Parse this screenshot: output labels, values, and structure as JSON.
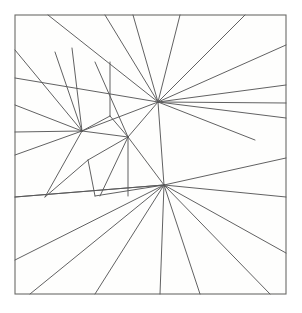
{
  "figure": {
    "name": "planar-line-arrangement",
    "caption": "",
    "canvas": {
      "width": 302,
      "height": 313
    },
    "colors": {
      "background": "#ffffff",
      "panel_fill": "#fefefd",
      "frame_stroke": "#6b6b68",
      "line_stroke": "#58585a"
    },
    "frame": {
      "x": 15,
      "y": 15,
      "width": 271,
      "height": 279
    },
    "hubs": [
      {
        "id": "hub-upper-right",
        "x": 158,
        "y": 102,
        "label": "A"
      },
      {
        "id": "hub-lower-center",
        "x": 164,
        "y": 185,
        "label": "B"
      },
      {
        "id": "hub-left",
        "x": 82,
        "y": 131,
        "label": "C"
      },
      {
        "id": "hub-middle",
        "x": 128,
        "y": 137,
        "label": "D"
      }
    ],
    "segments": [
      {
        "x1": 158,
        "y1": 102,
        "x2": 48,
        "y2": 15
      },
      {
        "x1": 158,
        "y1": 102,
        "x2": 105,
        "y2": 15
      },
      {
        "x1": 158,
        "y1": 102,
        "x2": 133,
        "y2": 15
      },
      {
        "x1": 158,
        "y1": 102,
        "x2": 180,
        "y2": 15
      },
      {
        "x1": 158,
        "y1": 102,
        "x2": 245,
        "y2": 15
      },
      {
        "x1": 158,
        "y1": 102,
        "x2": 286,
        "y2": 45
      },
      {
        "x1": 158,
        "y1": 102,
        "x2": 286,
        "y2": 85
      },
      {
        "x1": 158,
        "y1": 102,
        "x2": 286,
        "y2": 103
      },
      {
        "x1": 158,
        "y1": 102,
        "x2": 286,
        "y2": 118
      },
      {
        "x1": 158,
        "y1": 102,
        "x2": 255,
        "y2": 140
      },
      {
        "x1": 158,
        "y1": 102,
        "x2": 15,
        "y2": 78
      },
      {
        "x1": 158,
        "y1": 102,
        "x2": 82,
        "y2": 131
      },
      {
        "x1": 158,
        "y1": 102,
        "x2": 128,
        "y2": 137
      },
      {
        "x1": 158,
        "y1": 102,
        "x2": 164,
        "y2": 185
      },
      {
        "x1": 164,
        "y1": 185,
        "x2": 286,
        "y2": 158
      },
      {
        "x1": 164,
        "y1": 185,
        "x2": 286,
        "y2": 197
      },
      {
        "x1": 164,
        "y1": 185,
        "x2": 286,
        "y2": 253
      },
      {
        "x1": 164,
        "y1": 185,
        "x2": 270,
        "y2": 294
      },
      {
        "x1": 164,
        "y1": 185,
        "x2": 200,
        "y2": 294
      },
      {
        "x1": 164,
        "y1": 185,
        "x2": 160,
        "y2": 294
      },
      {
        "x1": 164,
        "y1": 185,
        "x2": 95,
        "y2": 294
      },
      {
        "x1": 164,
        "y1": 185,
        "x2": 30,
        "y2": 294
      },
      {
        "x1": 164,
        "y1": 185,
        "x2": 15,
        "y2": 260
      },
      {
        "x1": 164,
        "y1": 185,
        "x2": 15,
        "y2": 197
      },
      {
        "x1": 164,
        "y1": 185,
        "x2": 128,
        "y2": 137
      },
      {
        "x1": 82,
        "y1": 131,
        "x2": 15,
        "y2": 50
      },
      {
        "x1": 82,
        "y1": 131,
        "x2": 15,
        "y2": 105
      },
      {
        "x1": 82,
        "y1": 131,
        "x2": 15,
        "y2": 132
      },
      {
        "x1": 82,
        "y1": 131,
        "x2": 15,
        "y2": 155
      },
      {
        "x1": 82,
        "y1": 131,
        "x2": 45,
        "y2": 197
      },
      {
        "x1": 82,
        "y1": 131,
        "x2": 55,
        "y2": 52
      },
      {
        "x1": 82,
        "y1": 131,
        "x2": 72,
        "y2": 48
      },
      {
        "x1": 82,
        "y1": 131,
        "x2": 128,
        "y2": 137
      },
      {
        "x1": 82,
        "y1": 131,
        "x2": 110,
        "y2": 116
      },
      {
        "x1": 128,
        "y1": 137,
        "x2": 95,
        "y2": 62
      },
      {
        "x1": 128,
        "y1": 137,
        "x2": 110,
        "y2": 116
      },
      {
        "x1": 128,
        "y1": 137,
        "x2": 88,
        "y2": 160
      },
      {
        "x1": 128,
        "y1": 137,
        "x2": 100,
        "y2": 196
      },
      {
        "x1": 128,
        "y1": 137,
        "x2": 128,
        "y2": 196
      },
      {
        "x1": 55,
        "y1": 52,
        "x2": 55,
        "y2": 52
      },
      {
        "x1": 110,
        "y1": 62,
        "x2": 110,
        "y2": 116
      },
      {
        "x1": 72,
        "y1": 48,
        "x2": 72,
        "y2": 48
      },
      {
        "x1": 15,
        "y1": 197,
        "x2": 164,
        "y2": 185
      },
      {
        "x1": 45,
        "y1": 197,
        "x2": 88,
        "y2": 160
      },
      {
        "x1": 88,
        "y1": 160,
        "x2": 95,
        "y2": 196
      },
      {
        "x1": 95,
        "y1": 196,
        "x2": 164,
        "y2": 185
      }
    ]
  }
}
